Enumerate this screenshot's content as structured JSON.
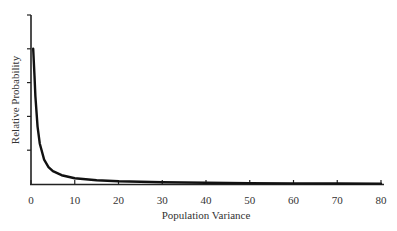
{
  "chart_data": {
    "type": "line",
    "title": "",
    "xlabel": "Population Variance",
    "ylabel": "Relative Probability",
    "xlim": [
      0,
      80
    ],
    "ylim": [
      0,
      5
    ],
    "x_ticks": [
      0,
      10,
      20,
      30,
      40,
      50,
      60,
      70,
      80
    ],
    "x_tick_labels": [
      "0",
      "10",
      "20",
      "30",
      "40",
      "50",
      "60",
      "70",
      "80"
    ],
    "y_ticks": [
      1,
      2,
      3,
      4,
      5
    ],
    "y_tick_labels": [],
    "grid": false,
    "legend": null,
    "series": [
      {
        "name": "density",
        "x": [
          0.5,
          0.8,
          1,
          1.5,
          2,
          3,
          4,
          5,
          7,
          10,
          15,
          20,
          30,
          40,
          50,
          60,
          70,
          80
        ],
        "values": [
          4.0,
          3.2,
          2.6,
          1.7,
          1.2,
          0.72,
          0.5,
          0.38,
          0.26,
          0.17,
          0.11,
          0.08,
          0.05,
          0.035,
          0.025,
          0.018,
          0.013,
          0.01
        ]
      }
    ]
  }
}
